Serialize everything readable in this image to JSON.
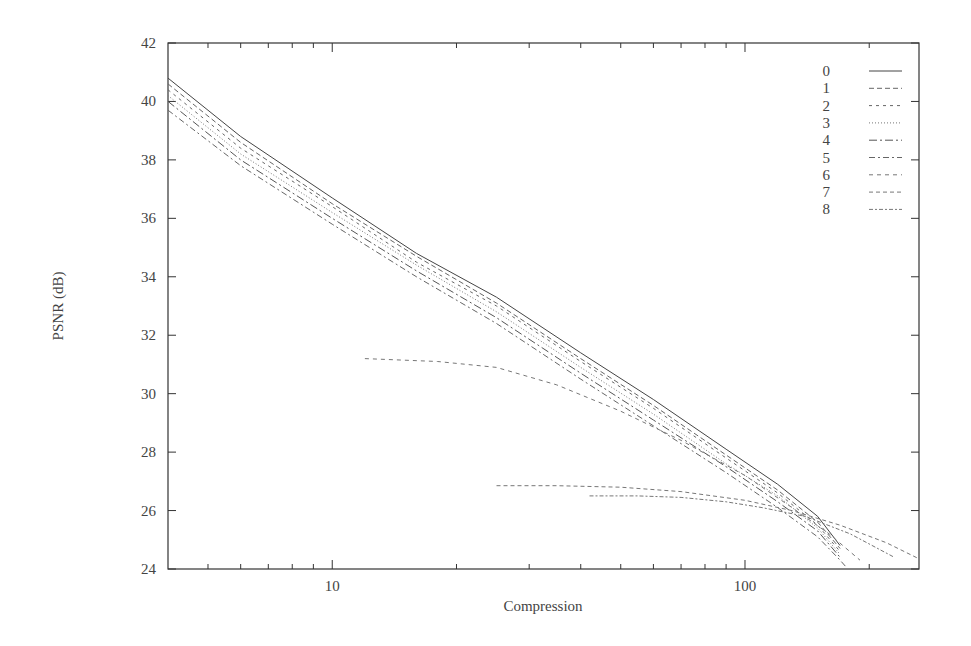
{
  "chart_data": {
    "type": "line",
    "title": "",
    "xlabel": "Compression",
    "ylabel": "PSNR (dB)",
    "xscale": "log",
    "xlim": [
      4,
      264
    ],
    "ylim": [
      24,
      42
    ],
    "x_ticks": [
      10,
      100
    ],
    "x_minor_ticks": [
      5,
      6,
      7,
      8,
      9,
      20,
      30,
      40,
      50,
      60,
      70,
      80,
      90,
      200
    ],
    "y_ticks": [
      24,
      26,
      28,
      30,
      32,
      34,
      36,
      38,
      40,
      42
    ],
    "grid": false,
    "legend_position": "top-right",
    "series": [
      {
        "name": "0",
        "dash": "",
        "color": "#444444",
        "x": [
          4,
          6,
          10,
          16,
          25,
          40,
          60,
          90,
          120,
          150,
          170
        ],
        "y": [
          40.8,
          38.8,
          36.7,
          34.8,
          33.3,
          31.4,
          29.8,
          28.1,
          26.9,
          25.8,
          24.8
        ]
      },
      {
        "name": "1",
        "dash": "5,3",
        "color": "#666666",
        "x": [
          4,
          6,
          10,
          16,
          25,
          40,
          60,
          90,
          120,
          150,
          170
        ],
        "y": [
          40.6,
          38.6,
          36.5,
          34.7,
          33.1,
          31.2,
          29.6,
          27.9,
          26.7,
          25.6,
          24.7
        ]
      },
      {
        "name": "2",
        "dash": "3,4",
        "color": "#666666",
        "x": [
          4,
          6,
          10,
          16,
          25,
          40,
          60,
          90,
          120,
          150,
          170
        ],
        "y": [
          40.4,
          38.4,
          36.4,
          34.5,
          33.0,
          31.1,
          29.5,
          27.8,
          26.6,
          25.5,
          24.6
        ]
      },
      {
        "name": "3",
        "dash": "1,2",
        "color": "#777777",
        "x": [
          4,
          6,
          10,
          16,
          25,
          40,
          60,
          90,
          120,
          150,
          170
        ],
        "y": [
          40.2,
          38.2,
          36.2,
          34.4,
          32.8,
          30.9,
          29.3,
          27.6,
          26.5,
          25.4,
          24.5
        ]
      },
      {
        "name": "4",
        "dash": "8,3,2,3",
        "color": "#555555",
        "x": [
          4,
          6,
          10,
          16,
          25,
          40,
          60,
          90,
          120,
          150,
          170
        ],
        "y": [
          40.0,
          38.0,
          36.0,
          34.2,
          32.6,
          30.7,
          29.1,
          27.5,
          26.3,
          25.3,
          24.4
        ]
      },
      {
        "name": "5",
        "dash": "6,3,2,3",
        "color": "#666666",
        "x": [
          4,
          6,
          10,
          16,
          25,
          40,
          60,
          90,
          120,
          150,
          170,
          175
        ],
        "y": [
          39.7,
          37.8,
          35.8,
          34.0,
          32.4,
          30.5,
          28.9,
          27.3,
          26.1,
          25.1,
          24.3,
          24.1
        ]
      },
      {
        "name": "6",
        "dash": "4,4",
        "color": "#777777",
        "x": [
          12,
          18,
          25,
          35,
          50,
          70,
          100,
          130,
          160,
          190
        ],
        "y": [
          31.2,
          31.1,
          30.9,
          30.3,
          29.4,
          28.4,
          27.2,
          26.1,
          25.2,
          24.3
        ]
      },
      {
        "name": "7",
        "dash": "4,3",
        "color": "#777777",
        "x": [
          25,
          35,
          50,
          70,
          100,
          130,
          170,
          220,
          264
        ],
        "y": [
          26.85,
          26.85,
          26.8,
          26.65,
          26.35,
          26.0,
          25.5,
          24.9,
          24.35
        ]
      },
      {
        "name": "8",
        "dash": "4,2,2,2",
        "color": "#777777",
        "x": [
          42,
          55,
          70,
          90,
          110,
          140,
          180,
          230
        ],
        "y": [
          26.5,
          26.5,
          26.45,
          26.3,
          26.1,
          25.8,
          25.2,
          24.4
        ]
      }
    ]
  }
}
